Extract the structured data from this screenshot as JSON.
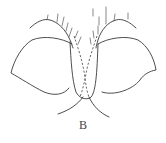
{
  "figure": {
    "label": "B",
    "colors": {
      "line": "#3a3a3a",
      "background": "#ffffff"
    }
  }
}
